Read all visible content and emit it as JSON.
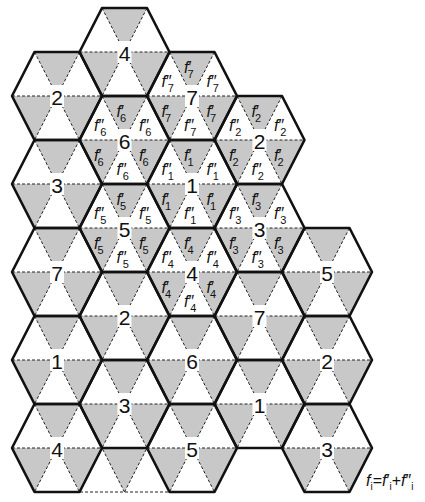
{
  "geometry": {
    "half_side": 22.5,
    "row_height": 44,
    "col_centers_x": [
      57,
      124.5,
      192,
      259.5,
      327
    ]
  },
  "colors": {
    "shaded_triangle": "#c8c8c8",
    "background": "#ffffff",
    "lines": "#111111"
  },
  "hexagons": [
    {
      "col": 0,
      "cy": 96,
      "label": "2"
    },
    {
      "col": 0,
      "cy": 184,
      "label": "3"
    },
    {
      "col": 0,
      "cy": 272,
      "label": "7"
    },
    {
      "col": 0,
      "cy": 360,
      "label": "1"
    },
    {
      "col": 0,
      "cy": 448,
      "label": "4"
    },
    {
      "col": 1,
      "cy": 52,
      "label": "4"
    },
    {
      "col": 1,
      "cy": 140,
      "label": "6",
      "sub": "6"
    },
    {
      "col": 1,
      "cy": 228,
      "label": "5",
      "sub": "5"
    },
    {
      "col": 1,
      "cy": 316,
      "label": "2"
    },
    {
      "col": 1,
      "cy": 404,
      "label": "3"
    },
    {
      "col": 2,
      "cy": 96,
      "label": "7",
      "sub": "7"
    },
    {
      "col": 2,
      "cy": 184,
      "label": "1",
      "sub": "1"
    },
    {
      "col": 2,
      "cy": 272,
      "label": "4",
      "sub": "4"
    },
    {
      "col": 2,
      "cy": 360,
      "label": "6"
    },
    {
      "col": 2,
      "cy": 448,
      "label": "5"
    },
    {
      "col": 3,
      "cy": 140,
      "label": "2",
      "sub": "2"
    },
    {
      "col": 3,
      "cy": 228,
      "label": "3",
      "sub": "3"
    },
    {
      "col": 3,
      "cy": 316,
      "label": "7"
    },
    {
      "col": 3,
      "cy": 404,
      "label": "1"
    },
    {
      "col": 4,
      "cy": 272,
      "label": "5"
    },
    {
      "col": 4,
      "cy": 360,
      "label": "2"
    },
    {
      "col": 4,
      "cy": 448,
      "label": "3"
    }
  ],
  "sector_labels": {
    "shaded_prefix": "f",
    "shaded_prime": "′",
    "white_prefix": "f",
    "white_prime": "″"
  },
  "extra_triangles": {
    "shaded": [
      [
        [
          102,
          448
        ],
        [
          147,
          448
        ],
        [
          124.5,
          492
        ]
      ]
    ],
    "dashed_lines": [
      [
        [
          80,
          492
        ],
        [
          170,
          492
        ]
      ],
      [
        [
          80,
          492
        ],
        [
          102,
          448
        ]
      ],
      [
        [
          124.5,
          492
        ],
        [
          102,
          448
        ]
      ],
      [
        [
          124.5,
          492
        ],
        [
          147,
          448
        ]
      ],
      [
        [
          170,
          492
        ],
        [
          147,
          448
        ]
      ]
    ]
  },
  "formula": {
    "lhs": "f",
    "lhs_sub": "i",
    "eq": "=",
    "t1": "f",
    "t1_prime": "′",
    "t1_sub": "i",
    "plus": "+",
    "t2": "f",
    "t2_prime": "″",
    "t2_sub": "i"
  }
}
